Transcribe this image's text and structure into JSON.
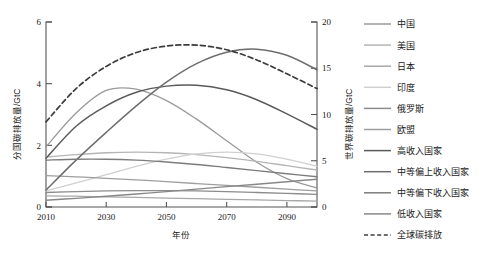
{
  "chart_data": {
    "type": "line",
    "title": "",
    "xlabel": "年份",
    "ylabel_left": "分国碳排放量/GtC",
    "ylabel_right": "世界碳排放量/GtC",
    "xlim": [
      2010,
      2100
    ],
    "ylim_left": [
      0,
      6
    ],
    "ylim_right": [
      0,
      20
    ],
    "xticks": [
      2010,
      2030,
      2050,
      2070,
      2090
    ],
    "xtick_labels": [
      "2010",
      "2030",
      "2050",
      "2070",
      "2090"
    ],
    "yticks_left": [
      0,
      2,
      4,
      6
    ],
    "ytick_labels_left": [
      "0",
      "2",
      "4",
      "6"
    ],
    "yticks_right": [
      0,
      5,
      10,
      15,
      20
    ],
    "ytick_labels_right": [
      "0",
      "5",
      "10",
      "15",
      "20"
    ],
    "grid": false,
    "legend_position": "right",
    "x": [
      2010,
      2020,
      2030,
      2040,
      2050,
      2060,
      2070,
      2080,
      2090,
      2100
    ],
    "series": [
      {
        "name": "中国",
        "axis": "left",
        "color": "#9a9a9a",
        "dash": "none",
        "width": 1.3,
        "values": [
          1.95,
          3.05,
          3.78,
          3.82,
          3.45,
          2.85,
          2.15,
          1.45,
          0.92,
          0.62
        ]
      },
      {
        "name": "美国",
        "axis": "left",
        "color": "#b5b5b5",
        "dash": "none",
        "width": 1.3,
        "values": [
          1.62,
          1.7,
          1.76,
          1.78,
          1.76,
          1.7,
          1.6,
          1.48,
          1.34,
          1.2
        ]
      },
      {
        "name": "日本",
        "axis": "left",
        "color": "#a8a8a8",
        "dash": "none",
        "width": 1.3,
        "values": [
          0.36,
          0.35,
          0.33,
          0.31,
          0.29,
          0.27,
          0.25,
          0.23,
          0.21,
          0.19
        ]
      },
      {
        "name": "印度",
        "axis": "left",
        "color": "#d0d0d0",
        "dash": "none",
        "width": 1.3,
        "values": [
          0.52,
          0.78,
          1.05,
          1.32,
          1.55,
          1.72,
          1.78,
          1.72,
          1.55,
          1.32
        ]
      },
      {
        "name": "俄罗斯",
        "axis": "left",
        "color": "#8c8c8c",
        "dash": "none",
        "width": 1.3,
        "values": [
          0.47,
          0.5,
          0.52,
          0.53,
          0.53,
          0.52,
          0.5,
          0.47,
          0.44,
          0.41
        ]
      },
      {
        "name": "欧盟",
        "axis": "left",
        "color": "#9e9e9e",
        "dash": "none",
        "width": 1.3,
        "values": [
          1.02,
          0.98,
          0.93,
          0.88,
          0.82,
          0.76,
          0.7,
          0.64,
          0.58,
          0.52
        ]
      },
      {
        "name": "高收入国家",
        "axis": "left",
        "color": "#5a5a5a",
        "dash": "none",
        "width": 1.5,
        "values": [
          1.58,
          2.62,
          3.28,
          3.72,
          3.92,
          3.95,
          3.8,
          3.48,
          3.02,
          2.52
        ]
      },
      {
        "name": "中等偏上收入国家",
        "axis": "left",
        "color": "#6e6e6e",
        "dash": "none",
        "width": 1.5,
        "values": [
          0.55,
          1.52,
          2.42,
          3.28,
          4.05,
          4.65,
          5.02,
          5.12,
          4.92,
          4.45
        ]
      },
      {
        "name": "中等偏下收入国家",
        "axis": "left",
        "color": "#7c7c7c",
        "dash": "none",
        "width": 1.4,
        "values": [
          1.52,
          1.55,
          1.55,
          1.52,
          1.46,
          1.38,
          1.28,
          1.18,
          1.08,
          0.98
        ]
      },
      {
        "name": "低收入国家",
        "axis": "left",
        "color": "#888888",
        "dash": "none",
        "width": 1.4,
        "values": [
          0.22,
          0.28,
          0.35,
          0.42,
          0.5,
          0.58,
          0.66,
          0.74,
          0.82,
          0.9
        ]
      },
      {
        "name": "全球碳排放",
        "axis": "right",
        "color": "#3c3c3c",
        "dash": "dashed",
        "width": 1.7,
        "values": [
          9.2,
          12.8,
          15.2,
          16.7,
          17.4,
          17.5,
          17.0,
          15.9,
          14.4,
          12.8
        ]
      }
    ]
  }
}
